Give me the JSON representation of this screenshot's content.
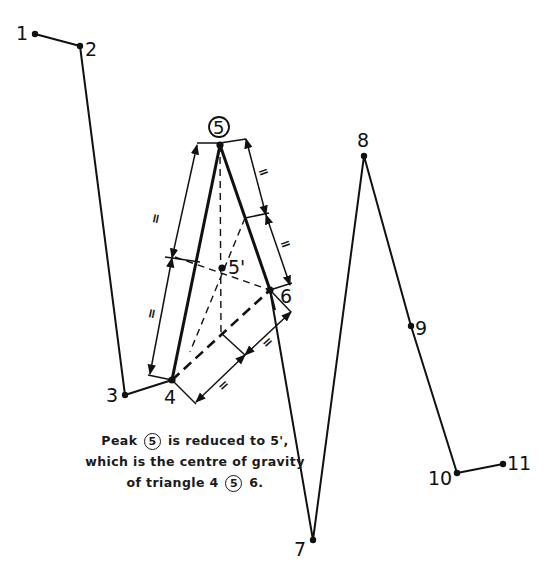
{
  "figure": {
    "points": [
      {
        "id": "1",
        "label": "1",
        "x": 35,
        "y": 34
      },
      {
        "id": "2",
        "label": "2",
        "x": 80,
        "y": 46
      },
      {
        "id": "3",
        "label": "3",
        "x": 125,
        "y": 395
      },
      {
        "id": "4",
        "label": "4",
        "x": 172,
        "y": 380
      },
      {
        "id": "5",
        "label": "5",
        "x": 220,
        "y": 145,
        "circled": true
      },
      {
        "id": "6",
        "label": "6",
        "x": 270,
        "y": 290
      },
      {
        "id": "7",
        "label": "7",
        "x": 313,
        "y": 540
      },
      {
        "id": "8",
        "label": "8",
        "x": 364,
        "y": 156
      },
      {
        "id": "9",
        "label": "9",
        "x": 411,
        "y": 326
      },
      {
        "id": "10",
        "label": "10",
        "x": 457,
        "y": 473
      },
      {
        "id": "11",
        "label": "11",
        "x": 503,
        "y": 464
      }
    ],
    "centroid": {
      "label": "5'",
      "x": 222,
      "y": 268
    },
    "equal_marks": [
      "=",
      "=",
      "=",
      "=",
      "=",
      "="
    ],
    "labels": {
      "p1": "1",
      "p2": "2",
      "p3": "3",
      "p4": "4",
      "p5": "5",
      "p6": "6",
      "p7": "7",
      "p8": "8",
      "p9": "9",
      "p10": "10",
      "p11": "11",
      "p5prime": "5'"
    }
  },
  "caption": {
    "line1_pre": "Peak",
    "line1_circled": "5",
    "line1_post": "is reduced to 5',",
    "line2": "which is the centre of gravity",
    "line3_pre": "of triangle 4",
    "line3_circled": "5",
    "line3_post": "6."
  }
}
